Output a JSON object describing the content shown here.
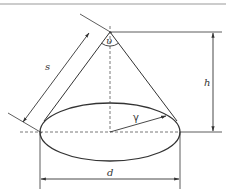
{
  "diagram": {
    "labels": {
      "slant": "s",
      "apex_angle": "υ",
      "height": "h",
      "diameter": "d",
      "radius_angle": "γ"
    },
    "colors": {
      "stroke": "#333333",
      "top_rule": "#9a9a9a",
      "background": "#ffffff"
    }
  }
}
